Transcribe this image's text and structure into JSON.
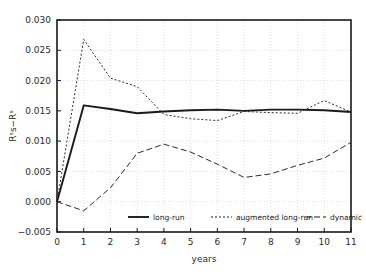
{
  "chart_data": {
    "type": "line",
    "title": "",
    "xlabel": "years",
    "ylabel": "Rˢs−Rˢ",
    "xlim": [
      0,
      11
    ],
    "ylim": [
      -0.005,
      0.03
    ],
    "grid": true,
    "legend_position": "bottom-inside",
    "x_ticks": [
      "0",
      "1",
      "2",
      "3",
      "4",
      "5",
      "6",
      "7",
      "8",
      "9",
      "10",
      "11"
    ],
    "y_ticks": [
      "-0.005",
      "0.000",
      "0.005",
      "0.010",
      "0.015",
      "0.020",
      "0.025",
      "0.030"
    ],
    "x": [
      0,
      1,
      2,
      3,
      4,
      5,
      6,
      7,
      8,
      9,
      10,
      11
    ],
    "series": [
      {
        "name": "long-run",
        "style": "solid",
        "color": "#1a1a1a",
        "values": [
          0.0,
          0.0159,
          0.0153,
          0.0146,
          0.0149,
          0.0151,
          0.0152,
          0.015,
          0.0152,
          0.0152,
          0.0151,
          0.0148
        ]
      },
      {
        "name": "augmented long-run",
        "style": "dotted",
        "color": "#2b2b2b",
        "values": [
          0.0,
          0.0268,
          0.0204,
          0.019,
          0.0144,
          0.0137,
          0.0134,
          0.0149,
          0.0147,
          0.0146,
          0.0167,
          0.0148
        ]
      },
      {
        "name": "dynamic",
        "style": "dashed",
        "color": "#2b2b2b",
        "values": [
          0.0,
          -0.0015,
          0.0023,
          0.008,
          0.0095,
          0.0082,
          0.0062,
          0.004,
          0.0046,
          0.006,
          0.0072,
          0.0098
        ]
      }
    ],
    "annotations": {
      "peak_augmented": "0.0268 at year 1",
      "trough_dynamic": "0.0040 near year 7"
    }
  },
  "legend": {
    "items": [
      {
        "label": "long-run",
        "style": "solid"
      },
      {
        "label": "augmented long-run",
        "style": "dotted"
      },
      {
        "label": "dynamic",
        "style": "dashed"
      }
    ]
  }
}
